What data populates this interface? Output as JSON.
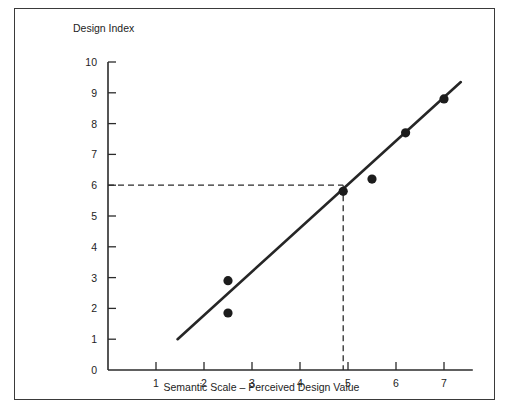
{
  "figure": {
    "frame_color": "#3a3a3a",
    "background": "#ffffff"
  },
  "chart_data": {
    "type": "scatter",
    "title": "",
    "xlabel": "Semantic Scale – Perceived Design Value",
    "ylabel": "Design Index",
    "xlim": [
      0,
      7.6
    ],
    "ylim": [
      0,
      10
    ],
    "xticks": [
      1,
      2,
      3,
      4,
      5,
      6,
      7
    ],
    "xticklabels": [
      "1",
      "2",
      "3",
      "4",
      "5",
      "6",
      "7"
    ],
    "yticks": [
      0,
      1,
      2,
      3,
      4,
      5,
      6,
      7,
      8,
      9,
      10
    ],
    "yticklabels": [
      "0",
      "1",
      "2",
      "3",
      "4",
      "5",
      "6",
      "7",
      "8",
      "9",
      "10"
    ],
    "grid": false,
    "legend": null,
    "points": [
      {
        "x": 2.5,
        "y": 2.9
      },
      {
        "x": 2.5,
        "y": 1.85
      },
      {
        "x": 4.9,
        "y": 5.8
      },
      {
        "x": 5.5,
        "y": 6.2
      },
      {
        "x": 6.2,
        "y": 7.7
      },
      {
        "x": 7.0,
        "y": 8.8
      }
    ],
    "trend_line": {
      "x_start": 1.45,
      "y_start": 1.0,
      "x_end": 7.35,
      "y_end": 9.35,
      "style": "solid",
      "color": "#262626"
    },
    "guides": [
      {
        "style": "dashed",
        "label": "horizontal-guide-at-6",
        "x_start": 0,
        "y_start": 6.0,
        "x_end": 4.9,
        "y_end": 6.0
      },
      {
        "style": "dashed",
        "label": "vertical-guide-at-5",
        "x_start": 4.9,
        "y_start": 6.0,
        "x_end": 4.9,
        "y_end": 0
      }
    ]
  },
  "axis_labels": {
    "y_axis_title": "Design Index",
    "x_axis_title": "Semantic Scale – Perceived Design Value"
  }
}
